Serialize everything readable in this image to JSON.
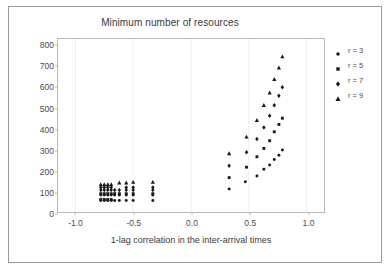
{
  "chart_data": {
    "type": "scatter",
    "title": "Minimum number of resources",
    "xlabel": "1-lag correlation in the inter-arrival times",
    "ylabel": "",
    "xlim": [
      -1.15,
      1.15
    ],
    "ylim": [
      0,
      830
    ],
    "xticks": [
      "-1.0",
      "-0.5",
      "0.0",
      "0.5",
      "1.0"
    ],
    "xtick_values": [
      -1.0,
      -0.5,
      0.0,
      0.5,
      1.0
    ],
    "yticks": [
      "0",
      "100",
      "200",
      "300",
      "400",
      "500",
      "600",
      "700",
      "800"
    ],
    "ytick_values": [
      0,
      100,
      200,
      300,
      400,
      500,
      600,
      700,
      800
    ],
    "grid": "faint vertical gridlines at x ticks",
    "legend_position": "right-outside",
    "marker_color": "#1a1a1a",
    "series": [
      {
        "name": "r = 3",
        "marker": "circle",
        "points": [
          [
            -0.78,
            55
          ],
          [
            -0.75,
            55
          ],
          [
            -0.72,
            55
          ],
          [
            -0.69,
            55
          ],
          [
            -0.66,
            55
          ],
          [
            -0.62,
            55
          ],
          [
            -0.56,
            55
          ],
          [
            -0.5,
            55
          ],
          [
            -0.33,
            55
          ],
          [
            -0.78,
            82
          ],
          [
            -0.75,
            82
          ],
          [
            -0.72,
            82
          ],
          [
            -0.69,
            82
          ],
          [
            -0.66,
            82
          ],
          [
            -0.62,
            82
          ],
          [
            -0.56,
            82
          ],
          [
            -0.5,
            82
          ],
          [
            -0.33,
            82
          ],
          [
            0.33,
            110
          ],
          [
            0.47,
            145
          ],
          [
            0.57,
            173
          ],
          [
            0.63,
            205
          ],
          [
            0.68,
            225
          ],
          [
            0.72,
            252
          ],
          [
            0.76,
            272
          ],
          [
            0.79,
            297
          ]
        ]
      },
      {
        "name": "r = 5",
        "marker": "square",
        "points": [
          [
            -0.78,
            60
          ],
          [
            -0.75,
            60
          ],
          [
            -0.72,
            60
          ],
          [
            -0.69,
            60
          ],
          [
            -0.78,
            88
          ],
          [
            -0.75,
            88
          ],
          [
            -0.72,
            88
          ],
          [
            -0.69,
            88
          ],
          [
            -0.66,
            88
          ],
          [
            -0.62,
            88
          ],
          [
            -0.56,
            88
          ],
          [
            -0.5,
            88
          ],
          [
            -0.33,
            88
          ],
          [
            0.33,
            165
          ],
          [
            0.48,
            215
          ],
          [
            0.57,
            265
          ],
          [
            0.63,
            305
          ],
          [
            0.68,
            342
          ],
          [
            0.72,
            385
          ],
          [
            0.76,
            420
          ],
          [
            0.79,
            450
          ]
        ]
      },
      {
        "name": "r = 7",
        "marker": "diamond",
        "points": [
          [
            -0.78,
            105
          ],
          [
            -0.75,
            105
          ],
          [
            -0.72,
            105
          ],
          [
            -0.69,
            105
          ],
          [
            -0.66,
            105
          ],
          [
            -0.62,
            105
          ],
          [
            -0.56,
            105
          ],
          [
            -0.5,
            105
          ],
          [
            -0.33,
            105
          ],
          [
            -0.78,
            118
          ],
          [
            -0.75,
            118
          ],
          [
            -0.72,
            118
          ],
          [
            -0.69,
            118
          ],
          [
            -0.56,
            118
          ],
          [
            -0.5,
            118
          ],
          [
            -0.33,
            118
          ],
          [
            0.33,
            222
          ],
          [
            0.48,
            287
          ],
          [
            0.57,
            350
          ],
          [
            0.63,
            405
          ],
          [
            0.68,
            462
          ],
          [
            0.72,
            512
          ],
          [
            0.76,
            558
          ],
          [
            0.79,
            598
          ]
        ]
      },
      {
        "name": "r = 9",
        "marker": "triangle",
        "points": [
          [
            -0.78,
            132
          ],
          [
            -0.75,
            132
          ],
          [
            -0.72,
            132
          ],
          [
            -0.69,
            132
          ],
          [
            -0.62,
            140
          ],
          [
            -0.56,
            140
          ],
          [
            -0.5,
            143
          ],
          [
            -0.33,
            143
          ],
          [
            0.33,
            280
          ],
          [
            0.48,
            360
          ],
          [
            0.57,
            440
          ],
          [
            0.63,
            512
          ],
          [
            0.68,
            572
          ],
          [
            0.72,
            637
          ],
          [
            0.76,
            692
          ],
          [
            0.79,
            745
          ]
        ]
      }
    ]
  },
  "legend": {
    "entries": [
      {
        "label": "r = 3",
        "marker": "circle"
      },
      {
        "label": "r = 5",
        "marker": "square"
      },
      {
        "label": "r = 7",
        "marker": "diamond"
      },
      {
        "label": "r = 9",
        "marker": "triangle"
      }
    ]
  }
}
